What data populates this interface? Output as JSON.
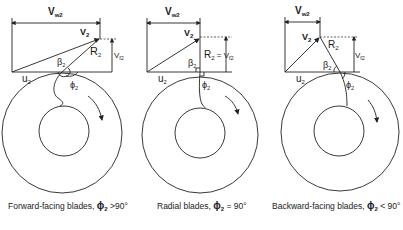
{
  "figure": {
    "panels": [
      {
        "id": "forward",
        "labels": {
          "vw2": "V",
          "vw2_sub": "w2",
          "v2": "V",
          "v2_sub": "2",
          "r2": "R",
          "r2_sub": "2",
          "vf2": "V",
          "vf2_sub": "f2",
          "u2": "u",
          "u2_sub": "2",
          "beta2": "β",
          "beta2_sub": "2",
          "phi2": "ϕ",
          "phi2_sub": "2"
        },
        "caption": "Forward-facing blades, ",
        "caption_phi": "ϕ",
        "caption_phi_sub": "2",
        "caption_cond": " >90°"
      },
      {
        "id": "radial",
        "labels": {
          "vw2": "V",
          "vw2_sub": "w2",
          "v2": "V",
          "v2_sub": "2",
          "r2vf2": "R",
          "r2_sub": "2",
          "r2vf2_eq": " = V",
          "vf2_sub": "f2",
          "u2": "u",
          "u2_sub": "2",
          "beta2": "β",
          "beta2_sub": "2",
          "phi2": "ϕ",
          "phi2_sub": "2"
        },
        "caption": "Radial blades, ",
        "caption_phi": "ϕ",
        "caption_phi_sub": "2",
        "caption_cond": " = 90°"
      },
      {
        "id": "backward",
        "labels": {
          "vw2": "V",
          "vw2_sub": "w2",
          "v2": "V",
          "v2_sub": "2",
          "r2": "R",
          "r2_sub": "2",
          "vf2": "V",
          "vf2_sub": "f2",
          "u2": "u",
          "u2_sub": "2",
          "beta2": "β",
          "beta2_sub": "2",
          "phi2": "ϕ",
          "phi2_sub": "2"
        },
        "caption": "Backward-facing blades, ",
        "caption_phi": "ϕ",
        "caption_phi_sub": "2",
        "caption_cond": " < 90°"
      }
    ]
  }
}
